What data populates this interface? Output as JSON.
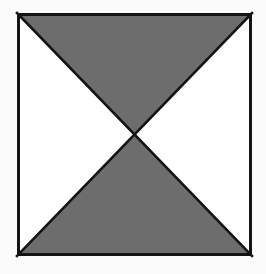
{
  "figure": {
    "kind": "geometric-diagram",
    "canvas": {
      "width": 266,
      "height": 274,
      "background_color": "#fbfbfb"
    },
    "square": {
      "name": "outer-square",
      "left": 17,
      "top": 13,
      "right": 252,
      "bottom": 256,
      "width": 235,
      "height": 243,
      "stroke_color": "#141414",
      "stroke_width": 3,
      "fill_color": "#ffffff"
    },
    "diagonals": {
      "name": "crossing-diagonals",
      "intersection_x": 134,
      "intersection_y": 134,
      "stroke_color": "#141414",
      "stroke_width": 2.6,
      "lines": [
        {
          "label": "top-left-to-bottom-right",
          "x1": 17,
          "y1": 13,
          "x2": 252,
          "y2": 256
        },
        {
          "label": "top-right-to-bottom-left",
          "x1": 252,
          "y1": 13,
          "x2": 17,
          "y2": 256
        }
      ]
    },
    "regions": [
      {
        "id": "top-triangle",
        "label": "Top triangle",
        "fill": "shaded",
        "fill_color": "#6d6d6d",
        "points": "17,13 252,13 134.5,134.5"
      },
      {
        "id": "right-triangle",
        "label": "Right triangle",
        "fill": "unshaded",
        "fill_color": "#ffffff",
        "points": "252,13 252,256 134.5,134.5"
      },
      {
        "id": "bottom-triangle",
        "label": "Bottom triangle",
        "fill": "shaded",
        "fill_color": "#6d6d6d",
        "points": "17,256 252,256 134.5,134.5"
      },
      {
        "id": "left-triangle",
        "label": "Left triangle",
        "fill": "unshaded",
        "fill_color": "#ffffff",
        "points": "17,13 17,256 134.5,134.5"
      }
    ],
    "colors": {
      "shaded": "#6d6d6d",
      "unshaded": "#ffffff",
      "outline": "#141414",
      "page_background": "#fbfbfb"
    }
  }
}
